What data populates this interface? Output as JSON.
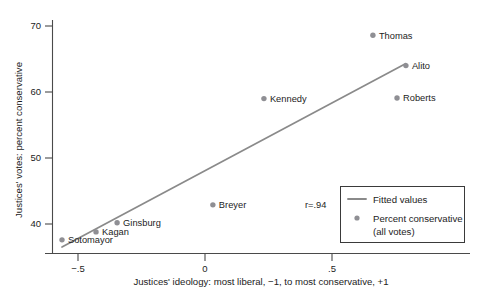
{
  "chart_data": {
    "type": "scatter",
    "title": "",
    "xlabel": "Justices' ideology: most liberal, −1, to most conservative, +1",
    "ylabel": "Justices' votes: percent conservative",
    "xlim": [
      -0.64,
      0.93
    ],
    "ylim": [
      36.2,
      71.5
    ],
    "xticks": [
      -0.5,
      0,
      0.5
    ],
    "xticklabels": [
      "−.5",
      "0",
      ".5"
    ],
    "yticks": [
      40,
      50,
      60,
      70
    ],
    "yticklabels": [
      "40",
      "50",
      "60",
      "70"
    ],
    "grid": false,
    "annotation": "r=.94",
    "legend_position": "lower-right",
    "points": [
      {
        "label": "Sotomayor",
        "x": -0.563,
        "y": 37.6,
        "label_side": "right"
      },
      {
        "label": "Kagan",
        "x": -0.429,
        "y": 38.8,
        "label_side": "right"
      },
      {
        "label": "Ginsburg",
        "x": -0.346,
        "y": 40.2,
        "label_side": "right"
      },
      {
        "label": "Breyer",
        "x": 0.031,
        "y": 42.9,
        "label_side": "right"
      },
      {
        "label": "Kennedy",
        "x": 0.232,
        "y": 59.0,
        "label_side": "right"
      },
      {
        "label": "Thomas",
        "x": 0.661,
        "y": 68.6,
        "label_side": "right"
      },
      {
        "label": "Alito",
        "x": 0.791,
        "y": 64.0,
        "label_side": "right"
      },
      {
        "label": "Roberts",
        "x": 0.756,
        "y": 59.1,
        "label_side": "right"
      }
    ],
    "fitted_line": {
      "name": "Fitted values",
      "x_start": -0.563,
      "y_start": 36.5,
      "x_end": 0.791,
      "y_end": 64.3
    },
    "series": [
      {
        "name": "Percent conservative (all votes)",
        "x": [
          -0.563,
          -0.429,
          -0.346,
          0.031,
          0.232,
          0.661,
          0.791,
          0.756
        ],
        "values": [
          37.6,
          38.8,
          40.2,
          42.9,
          59.0,
          68.6,
          64.0,
          59.1
        ]
      }
    ],
    "legend": [
      {
        "marker": "line",
        "label": "Fitted values"
      },
      {
        "marker": "dot",
        "label": "Percent conservative",
        "label2": "(all votes)"
      }
    ],
    "colors": {
      "fitted_line": "#8a8a8a",
      "point": "#8f8f94",
      "axis": "#4a4a4a",
      "text": "#1c1c1c",
      "background": "#ffffff"
    }
  }
}
